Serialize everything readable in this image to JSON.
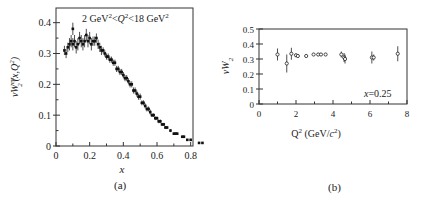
{
  "chart_data": [
    {
      "panel": "(a)",
      "type": "scatter",
      "title": "",
      "annotation": "2 GeV²<Q²<18 GeV²",
      "xlabel": "x",
      "ylabel": "νW₂^{ep}(x,Q²)",
      "xlim": [
        0,
        0.9
      ],
      "ylim": [
        0,
        0.42
      ],
      "xticks": [
        0,
        0.2,
        0.4,
        0.6,
        0.8
      ],
      "xtick_labels": [
        "0",
        "0.2",
        "0.4",
        "0.6",
        "0.8"
      ],
      "yticks": [
        0,
        0.1,
        0.2,
        0.3,
        0.4
      ],
      "ytick_labels": [
        "0",
        "0.1",
        "0.2",
        "0.3",
        "0.4"
      ],
      "grid": false,
      "legend": null,
      "x": [
        0.05,
        0.06,
        0.07,
        0.08,
        0.09,
        0.1,
        0.1,
        0.11,
        0.12,
        0.13,
        0.14,
        0.15,
        0.16,
        0.17,
        0.18,
        0.19,
        0.2,
        0.21,
        0.22,
        0.23,
        0.24,
        0.25,
        0.26,
        0.27,
        0.28,
        0.29,
        0.3,
        0.31,
        0.32,
        0.33,
        0.34,
        0.35,
        0.36,
        0.37,
        0.38,
        0.39,
        0.4,
        0.41,
        0.42,
        0.43,
        0.44,
        0.45,
        0.46,
        0.47,
        0.48,
        0.49,
        0.5,
        0.51,
        0.52,
        0.53,
        0.54,
        0.55,
        0.56,
        0.57,
        0.58,
        0.59,
        0.6,
        0.61,
        0.62,
        0.63,
        0.64,
        0.65,
        0.66,
        0.68,
        0.7,
        0.71,
        0.72,
        0.75,
        0.76,
        0.78,
        0.8,
        0.85,
        0.87
      ],
      "y": [
        0.31,
        0.3,
        0.32,
        0.33,
        0.34,
        0.33,
        0.38,
        0.34,
        0.32,
        0.33,
        0.35,
        0.34,
        0.33,
        0.34,
        0.36,
        0.34,
        0.35,
        0.33,
        0.34,
        0.34,
        0.35,
        0.33,
        0.32,
        0.31,
        0.31,
        0.3,
        0.29,
        0.29,
        0.28,
        0.28,
        0.27,
        0.27,
        0.25,
        0.25,
        0.24,
        0.24,
        0.23,
        0.22,
        0.22,
        0.21,
        0.2,
        0.2,
        0.18,
        0.18,
        0.17,
        0.16,
        0.16,
        0.14,
        0.14,
        0.13,
        0.12,
        0.12,
        0.11,
        0.1,
        0.1,
        0.09,
        0.09,
        0.08,
        0.08,
        0.07,
        0.07,
        0.06,
        0.06,
        0.05,
        0.04,
        0.04,
        0.04,
        0.03,
        0.03,
        0.02,
        0.02,
        0.01,
        0.01
      ],
      "yerr": [
        0.015,
        0.015,
        0.015,
        0.02,
        0.02,
        0.02,
        0.02,
        0.02,
        0.02,
        0.02,
        0.02,
        0.02,
        0.02,
        0.02,
        0.02,
        0.02,
        0.02,
        0.02,
        0.015,
        0.015,
        0.015,
        0.015,
        0.015,
        0.015,
        0.01,
        0.01,
        0.01,
        0.01,
        0.01,
        0.01,
        0.01,
        0.01,
        0.01,
        0.01,
        0.01,
        0.01,
        0.01,
        0.01,
        0.01,
        0.01,
        0.01,
        0.01,
        0.01,
        0.01,
        0.01,
        0.01,
        0.01,
        0.008,
        0.008,
        0.008,
        0.008,
        0.008,
        0.008,
        0.006,
        0.006,
        0.006,
        0.006,
        0.006,
        0.006,
        0.005,
        0.005,
        0.005,
        0.005,
        0.005,
        0.004,
        0.004,
        0.004,
        0.004,
        0.004,
        0.003,
        0.003,
        0.003,
        0.003
      ]
    },
    {
      "panel": "(b)",
      "type": "scatter",
      "title": "",
      "annotation": "x = 0.25",
      "xlabel": "Q² (GeV/c²)",
      "ylabel": "νW₂",
      "xlim": [
        0,
        8
      ],
      "ylim": [
        0,
        0.5
      ],
      "xticks": [
        0,
        2,
        4,
        6,
        8
      ],
      "xtick_labels": [
        "0",
        "2",
        "4",
        "6",
        "8"
      ],
      "yticks": [
        0,
        0.1,
        0.2,
        0.3,
        0.4,
        0.5
      ],
      "ytick_labels": [
        "0",
        "0.1",
        "0.2",
        "0.3",
        "0.4",
        "0.5"
      ],
      "grid": false,
      "legend": null,
      "x": [
        1.0,
        1.5,
        1.75,
        2.0,
        2.1,
        2.55,
        2.95,
        3.2,
        3.35,
        3.6,
        4.45,
        4.6,
        4.65,
        6.1,
        6.2,
        7.5
      ],
      "y": [
        0.33,
        0.27,
        0.335,
        0.325,
        0.32,
        0.32,
        0.33,
        0.33,
        0.33,
        0.33,
        0.33,
        0.31,
        0.3,
        0.31,
        0.31,
        0.335
      ],
      "yerr": [
        0.04,
        0.06,
        0.04,
        0.01,
        0.01,
        0.01,
        0.01,
        0.01,
        0.01,
        0.01,
        0.02,
        0.03,
        0.03,
        0.04,
        0.02,
        0.05
      ]
    }
  ],
  "captions": {
    "a": "(a)",
    "b": "(b)"
  }
}
